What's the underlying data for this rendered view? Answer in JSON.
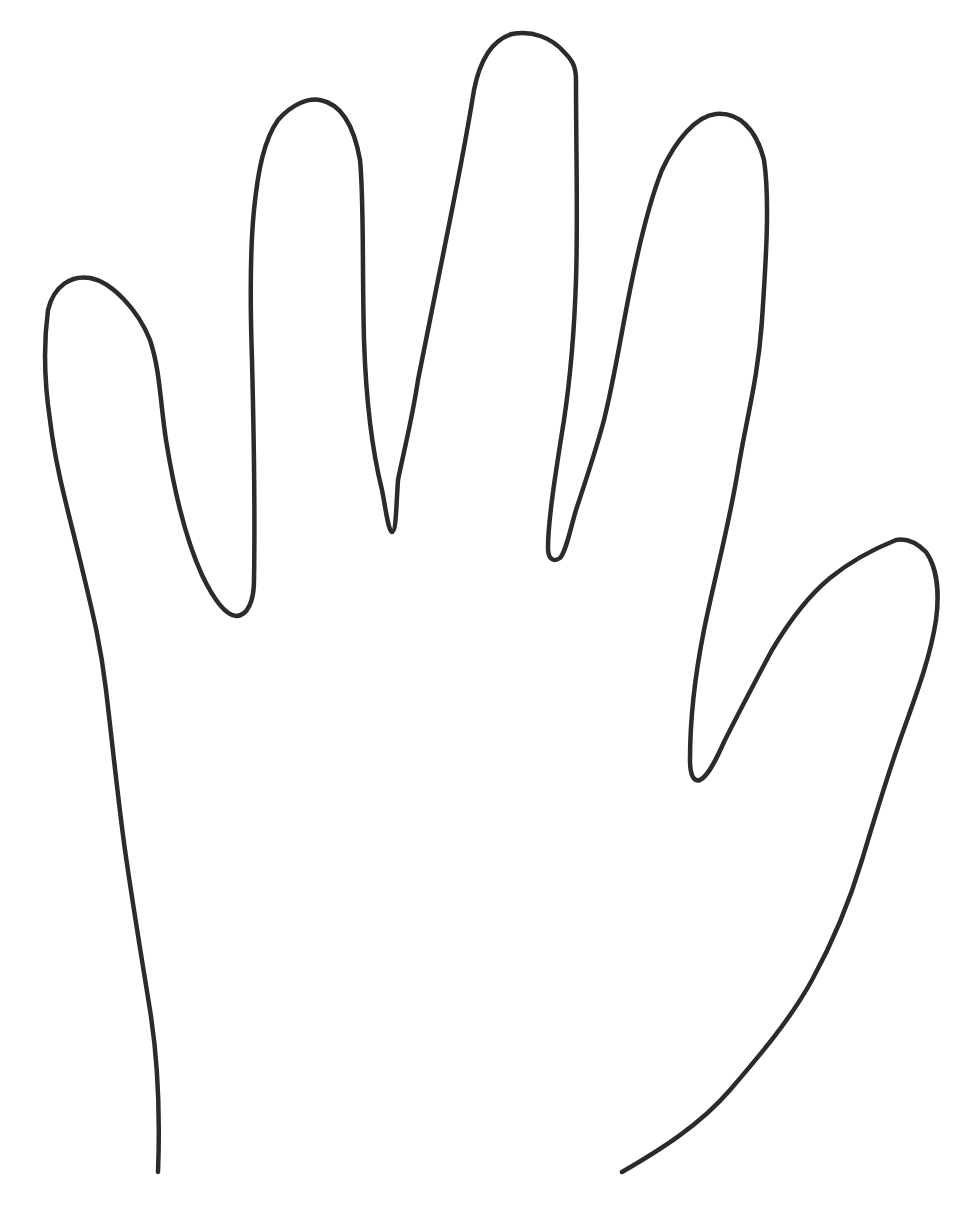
{
  "drawing": {
    "subject": "Hand outline",
    "background_color": "#ffffff",
    "stroke_color": "#2b2b2b",
    "fingers": [
      "thumb-side finger (left)",
      "index",
      "middle",
      "ring",
      "thumb (right)"
    ]
  }
}
